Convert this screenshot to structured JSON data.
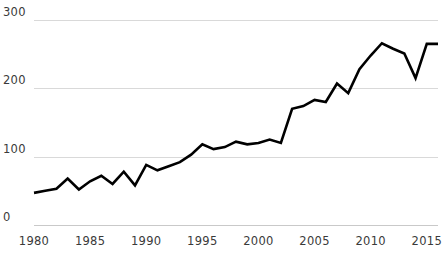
{
  "chart_data": {
    "type": "line",
    "title": "",
    "subtitle": "",
    "xlabel": "",
    "ylabel": "",
    "xlim": [
      1980,
      2016
    ],
    "ylim": [
      0,
      300
    ],
    "grid": true,
    "legend": "none",
    "line_color": "#000000",
    "grid_color": "#d9d9d9",
    "y_ticks": [
      0,
      100,
      200,
      300
    ],
    "y_tick_labels": [
      "0",
      "100",
      "200",
      "300"
    ],
    "x_ticks": [
      1980,
      1985,
      1990,
      1995,
      2000,
      2005,
      2010,
      2015
    ],
    "x_tick_labels": [
      "1980",
      "1985",
      "1990",
      "1995",
      "2000",
      "2005",
      "2010",
      "2015"
    ],
    "x": [
      1980,
      1981,
      1982,
      1983,
      1984,
      1985,
      1986,
      1987,
      1988,
      1989,
      1990,
      1991,
      1992,
      1993,
      1994,
      1995,
      1996,
      1997,
      1998,
      1999,
      2000,
      2001,
      2002,
      2003,
      2004,
      2005,
      2006,
      2007,
      2008,
      2009,
      2010,
      2011,
      2012,
      2013,
      2014,
      2015,
      2016
    ],
    "values": [
      47,
      50,
      53,
      68,
      52,
      64,
      72,
      60,
      78,
      58,
      88,
      80,
      86,
      92,
      103,
      118,
      111,
      114,
      122,
      118,
      120,
      125,
      120,
      170,
      174,
      183,
      180,
      207,
      193,
      228,
      248,
      266,
      258,
      251,
      215,
      265,
      265
    ],
    "series": [
      {
        "name": "value",
        "values": [
          47,
          50,
          53,
          68,
          52,
          64,
          72,
          60,
          78,
          58,
          88,
          80,
          86,
          92,
          103,
          118,
          111,
          114,
          122,
          118,
          120,
          125,
          120,
          170,
          174,
          183,
          180,
          207,
          193,
          228,
          248,
          266,
          258,
          251,
          215,
          265,
          265
        ]
      }
    ],
    "annotations": []
  },
  "plot_geometry": {
    "left": 34,
    "right": 438,
    "top": 20,
    "bottom": 225
  }
}
